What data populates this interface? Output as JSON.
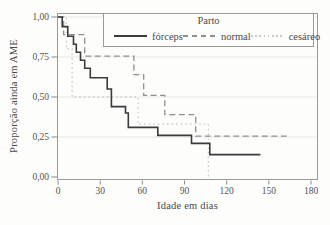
{
  "figure": {
    "background": "#fdfdfc",
    "frame_color": "#9a9a9a",
    "grid_color": "#e7e7e4",
    "tick_color": "#8a8a8a",
    "text_color": "#525252"
  },
  "chart_data": {
    "type": "line",
    "subtype": "kaplan-meier-step",
    "title": "",
    "xlabel": "Idade em dias",
    "ylabel": "Proporção ainda em AME",
    "xlim": [
      0,
      185
    ],
    "ylim": [
      0,
      1
    ],
    "grid": "horizontal-light",
    "x_ticks": [
      0,
      30,
      60,
      90,
      120,
      150,
      180
    ],
    "y_ticks": [
      {
        "value": 1.0,
        "label": "1,00"
      },
      {
        "value": 0.75,
        "label": "0,75"
      },
      {
        "value": 0.5,
        "label": "0,50"
      },
      {
        "value": 0.25,
        "label": "0,25"
      },
      {
        "value": 0.0,
        "label": "0,00"
      }
    ],
    "legend": {
      "title": "Parto",
      "position": "top-right",
      "entries": [
        "fórceps",
        "normal",
        "cesáreo"
      ]
    },
    "series": [
      {
        "key": "forceps",
        "name": "fórceps",
        "style": "solid",
        "color": "#3b3b3b",
        "width": 1.6,
        "dash": "",
        "steps": [
          [
            0,
            1.0
          ],
          [
            3,
            0.94
          ],
          [
            7,
            0.88
          ],
          [
            11,
            0.83
          ],
          [
            13,
            0.78
          ],
          [
            16,
            0.73
          ],
          [
            19,
            0.68
          ],
          [
            23,
            0.62
          ],
          [
            35,
            0.55
          ],
          [
            38,
            0.44
          ],
          [
            48,
            0.4
          ],
          [
            50,
            0.31
          ],
          [
            71,
            0.26
          ],
          [
            95,
            0.21
          ],
          [
            108,
            0.14
          ]
        ],
        "end_day": 144
      },
      {
        "key": "normal",
        "name": "normal",
        "style": "dashed",
        "color": "#8f8f8f",
        "width": 1.3,
        "dash": "6 3.5",
        "steps": [
          [
            0,
            1.0
          ],
          [
            4,
            0.89
          ],
          [
            19,
            0.755
          ],
          [
            54,
            0.64
          ],
          [
            61,
            0.51
          ],
          [
            76,
            0.39
          ],
          [
            98,
            0.255
          ]
        ],
        "end_day": 164
      },
      {
        "key": "cesareo",
        "name": "cesáreo",
        "style": "dotted",
        "color": "#c9c9c9",
        "width": 1.3,
        "dash": "1.6 3",
        "steps": [
          [
            0,
            1.0
          ],
          [
            6,
            0.8
          ],
          [
            10,
            0.5
          ],
          [
            57,
            0.33
          ],
          [
            107,
            0.0
          ]
        ],
        "end_day": 107
      }
    ]
  }
}
